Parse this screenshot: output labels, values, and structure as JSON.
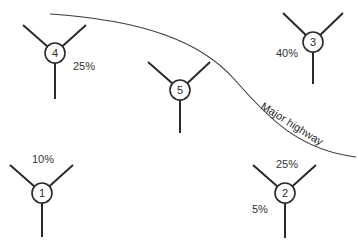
{
  "diagram": {
    "highway": {
      "label": "Major highway",
      "path": "M 50 14 C 140 20, 200 40, 235 80 S 300 150, 356 157",
      "label_x": 290,
      "label_y": 127,
      "label_rotate": 32
    },
    "nodes": [
      {
        "id": "1",
        "cx": 42,
        "cy": 193,
        "r": 10,
        "arms": [
          [
            10,
            165
          ],
          [
            73,
            165
          ],
          [
            42,
            237
          ]
        ],
        "labels": [
          {
            "text": "10%",
            "x": 32,
            "y": 163
          }
        ]
      },
      {
        "id": "2",
        "cx": 285,
        "cy": 193,
        "r": 10,
        "arms": [
          [
            253,
            165
          ],
          [
            316,
            165
          ],
          [
            285,
            238
          ]
        ],
        "labels": [
          {
            "text": "25%",
            "x": 276,
            "y": 168
          },
          {
            "text": "5%",
            "x": 252,
            "y": 213
          }
        ]
      },
      {
        "id": "3",
        "cx": 313,
        "cy": 42,
        "r": 10,
        "arms": [
          [
            283,
            13
          ],
          [
            343,
            13
          ],
          [
            313,
            84
          ]
        ],
        "labels": [
          {
            "text": "40%",
            "x": 276,
            "y": 57
          }
        ]
      },
      {
        "id": "4",
        "cx": 55,
        "cy": 53,
        "r": 10,
        "arms": [
          [
            23,
            25
          ],
          [
            86,
            25
          ],
          [
            55,
            99
          ]
        ],
        "labels": [
          {
            "text": "25%",
            "x": 73,
            "y": 70
          }
        ]
      },
      {
        "id": "5",
        "cx": 180,
        "cy": 90,
        "r": 10,
        "arms": [
          [
            148,
            62
          ],
          [
            210,
            62
          ],
          [
            180,
            133
          ]
        ],
        "labels": []
      }
    ]
  }
}
